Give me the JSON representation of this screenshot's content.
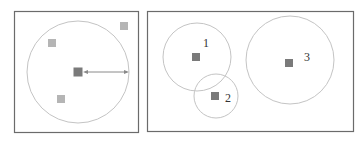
{
  "colors": {
    "frame": "#6b6b6b",
    "circle": "#bdbdbd",
    "point_dark": "#7a7a7a",
    "point_light": "#b5b5b5",
    "arrow": "#8a8a8a"
  },
  "left_panel": {
    "description": "single cluster with radius arrow",
    "circle": {
      "cx": 78,
      "cy": 72,
      "r": 51
    },
    "center_point": {
      "x": 78,
      "y": 72
    },
    "points": [
      {
        "x": 52,
        "y": 43
      },
      {
        "x": 124,
        "y": 26
      },
      {
        "x": 61,
        "y": 99
      }
    ],
    "radius_arrow": {
      "x1": 85,
      "y1": 72,
      "x2": 128,
      "y2": 72
    }
  },
  "right_panel": {
    "clusters": [
      {
        "label": "1",
        "cx": 197,
        "cy": 57,
        "r": 34,
        "point": {
          "x": 196,
          "y": 57
        },
        "label_pos": {
          "x": 205,
          "y": 46
        }
      },
      {
        "label": "2",
        "cx": 216,
        "cy": 96,
        "r": 22,
        "point": {
          "x": 215,
          "y": 96
        },
        "label_pos": {
          "x": 226,
          "y": 102
        }
      },
      {
        "label": "3",
        "cx": 290,
        "cy": 60,
        "r": 44,
        "point": {
          "x": 289,
          "y": 63
        },
        "label_pos": {
          "x": 305,
          "y": 61
        }
      }
    ]
  }
}
